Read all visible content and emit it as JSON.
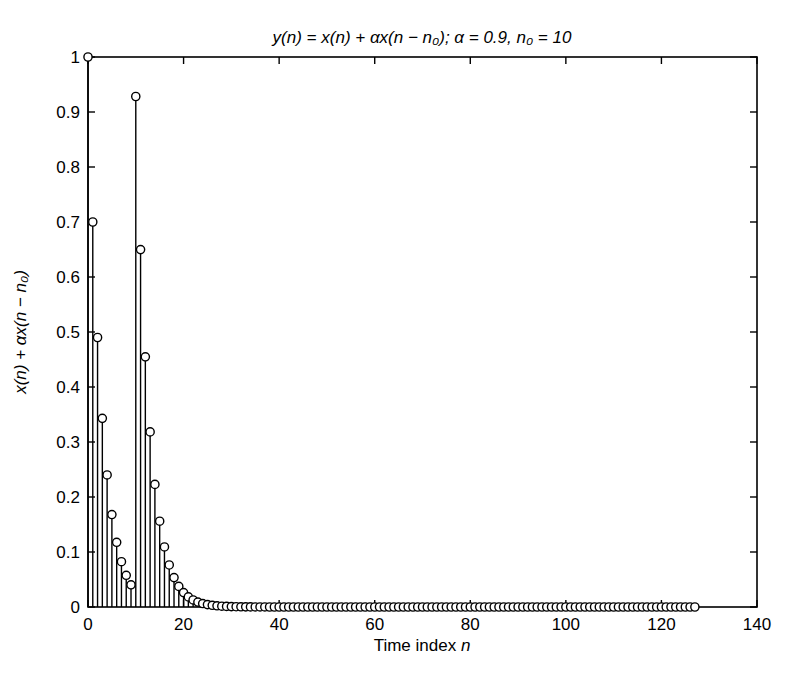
{
  "figure": {
    "xlabel_prefix": "Time index ",
    "xlabel_var": "n"
  },
  "chart_data": {
    "type": "stem",
    "title": "y(n) = x(n) + αx(n − n₀); α = 0.9, n₀ = 10",
    "xlabel": "Time index n",
    "ylabel": "x(n) + αx(n − n₀)",
    "alpha": 0.9,
    "n0": 10,
    "xlim": [
      0,
      140
    ],
    "ylim": [
      0,
      1
    ],
    "xticks": [
      0,
      20,
      40,
      60,
      80,
      100,
      120,
      140
    ],
    "xtick_labels": [
      "0",
      "20",
      "40",
      "60",
      "80",
      "100",
      "120",
      "140"
    ],
    "yticks": [
      0,
      0.1,
      0.2,
      0.3,
      0.4,
      0.5,
      0.6,
      0.7,
      0.8,
      0.9,
      1
    ],
    "ytick_labels": [
      "0",
      "0.1",
      "0.2",
      "0.3",
      "0.4",
      "0.5",
      "0.6",
      "0.7",
      "0.8",
      "0.9",
      "1"
    ],
    "n_range": [
      0,
      127
    ],
    "grid": false,
    "legend": null,
    "marker": "open-circle",
    "line_color": "#000000",
    "marker_fill": "#ffffff",
    "background": "#ffffff",
    "values": [
      1,
      0.7,
      0.49,
      0.343,
      0.2401,
      0.1681,
      0.1176,
      0.0824,
      0.0576,
      0.0404,
      0.9282,
      0.6498,
      0.4548,
      0.3184,
      0.2229,
      0.156,
      0.1092,
      0.0764,
      0.0535,
      0.0375,
      0.0262,
      0.0184,
      0.0128,
      0.009,
      0.0063,
      0.0044,
      0.0031,
      0.0022,
      0.0015,
      0.0011,
      0.0007,
      0.0005,
      0.0004,
      0.0003,
      0.0002,
      0.0001,
      0.0001,
      0.0001,
      0,
      0,
      0,
      0,
      0,
      0,
      0,
      0,
      0,
      0,
      0,
      0,
      0,
      0,
      0,
      0,
      0,
      0,
      0,
      0,
      0,
      0,
      0,
      0,
      0,
      0,
      0,
      0,
      0,
      0,
      0,
      0,
      0,
      0,
      0,
      0,
      0,
      0,
      0,
      0,
      0,
      0,
      0,
      0,
      0,
      0,
      0,
      0,
      0,
      0,
      0,
      0,
      0,
      0,
      0,
      0,
      0,
      0,
      0,
      0,
      0,
      0,
      0,
      0,
      0,
      0,
      0,
      0,
      0,
      0,
      0,
      0,
      0,
      0,
      0,
      0,
      0,
      0,
      0,
      0,
      0,
      0,
      0,
      0,
      0,
      0,
      0,
      0,
      0,
      0
    ]
  }
}
